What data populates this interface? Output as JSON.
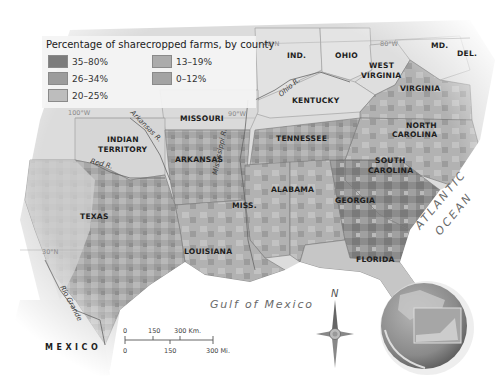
{
  "legend": {
    "title": "Percentage of sharecropped farms, by county",
    "items": [
      {
        "label": "35–80%",
        "color": "#7c7c7c"
      },
      {
        "label": "26–34%",
        "color": "#9c9c9c"
      },
      {
        "label": "20–25%",
        "color": "#bdbdbd"
      },
      {
        "label": "13–19%",
        "color": "#ababab"
      },
      {
        "label": "0–12%",
        "color": "#a3a3a3"
      }
    ]
  },
  "states": {
    "ind": "IND.",
    "ohio": "OHIO",
    "md": "MD.",
    "del": "DEL.",
    "west_virginia_1": "WEST",
    "west_virginia_2": "VIRGINIA",
    "virginia": "VIRGINIA",
    "kentucky": "KENTUCKY",
    "missouri": "MISSOURI",
    "indian_territory_1": "INDIAN",
    "indian_territory_2": "TERRITORY",
    "arkansas": "ARKANSAS",
    "tennessee": "TENNESSEE",
    "north_carolina_1": "NORTH",
    "north_carolina_2": "CAROLINA",
    "south_carolina_1": "SOUTH",
    "south_carolina_2": "CAROLINA",
    "alabama": "ALABAMA",
    "georgia": "GEORGIA",
    "miss": "MISS.",
    "texas": "TEXAS",
    "louisiana": "LOUISIANA",
    "florida": "FLORIDA"
  },
  "rivers": {
    "ohio": "Ohio R.",
    "arkansas": "Arkansas R.",
    "red": "Red R.",
    "mississippi": "Mississippi R.",
    "rio_grande": "Rio Grande"
  },
  "graticule": {
    "lat40": "40°N",
    "lon80": "80°W",
    "lon100": "100°W",
    "lon90": "90°W",
    "lat30": "30°N"
  },
  "water": {
    "atlantic_1": "ATLANTIC",
    "atlantic_2": "OCEAN",
    "gulf": "Gulf of Mexico"
  },
  "country": {
    "mexico": "MEXICO"
  },
  "scale_bar": {
    "km_0": "0",
    "km_150": "150",
    "km_300": "300 Km.",
    "mi_0": "0",
    "mi_150": "150",
    "mi_300": "300 Mi."
  },
  "compass": {
    "north": "N"
  }
}
